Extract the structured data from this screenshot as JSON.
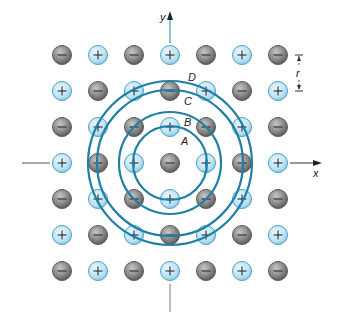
{
  "axes": {
    "x_label": "x",
    "y_label": "y"
  },
  "spacing_label": "r",
  "lattice": {
    "rows": 7,
    "cols": 7,
    "center_ion": "-",
    "pattern": "alternating charges; ion at (i,j) is '-' when (i+j) is even, '+' otherwise",
    "ions": [
      [
        "-",
        "+",
        "-",
        "+",
        "-",
        "+",
        "-"
      ],
      [
        "+",
        "-",
        "+",
        "-",
        "+",
        "-",
        "+"
      ],
      [
        "-",
        "+",
        "-",
        "+",
        "-",
        "+",
        "-"
      ],
      [
        "+",
        "-",
        "+",
        "-",
        "+",
        "-",
        "+"
      ],
      [
        "-",
        "+",
        "-",
        "+",
        "-",
        "+",
        "-"
      ],
      [
        "+",
        "-",
        "+",
        "-",
        "+",
        "-",
        "+"
      ],
      [
        "-",
        "+",
        "-",
        "+",
        "-",
        "+",
        "-"
      ]
    ]
  },
  "shells": [
    {
      "label": "A",
      "passes_through": "nearest neighbors (+), distance r"
    },
    {
      "label": "B",
      "passes_through": "diagonal neighbors (-), distance √2 r"
    },
    {
      "label": "C",
      "passes_through": "second neighbors along axes (-), distance 2r"
    },
    {
      "label": "D",
      "passes_through": "ions at distance √5 r (+)"
    }
  ],
  "colors": {
    "positive_fill": "#bfe3f3",
    "positive_stroke": "#4aa3c8",
    "negative_fill": "#8a8a8a",
    "negative_stroke": "#5a5a5a",
    "shell_stroke": "#1f7fa6",
    "axis_stroke": "#333333",
    "y_axis_stroke": "#3aa0b8"
  },
  "charge_symbols": {
    "positive": "+",
    "negative": "−"
  }
}
